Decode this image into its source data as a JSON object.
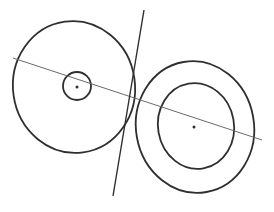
{
  "diagram": {
    "width": 274,
    "height": 212,
    "background": "#ffffff",
    "stroke_color": "#2f2f2f",
    "thin_stroke_color": "#6a6a6a",
    "shapes": {
      "left_outer_ellipse": {
        "cx": 74,
        "cy": 87,
        "rx": 61,
        "ry": 66,
        "rotate": -8,
        "stroke_width": 1.8
      },
      "left_inner_circle": {
        "cx": 77,
        "cy": 86,
        "rx": 14,
        "ry": 14,
        "rotate": 0,
        "stroke_width": 1.8
      },
      "right_outer_ellipse": {
        "cx": 195,
        "cy": 127,
        "rx": 59,
        "ry": 66,
        "rotate": -10,
        "stroke_width": 1.8
      },
      "right_inner_ellipse": {
        "cx": 196,
        "cy": 126,
        "rx": 38,
        "ry": 43,
        "rotate": -10,
        "stroke_width": 1.8
      },
      "left_center_dot": {
        "cx": 77,
        "cy": 87,
        "r": 1.5
      },
      "right_center_dot": {
        "cx": 194,
        "cy": 127,
        "r": 1.5
      },
      "center_line": {
        "x1": 13,
        "y1": 58,
        "x2": 262,
        "y2": 140,
        "stroke_width": 1
      },
      "tangent_line": {
        "x1": 144,
        "y1": 10,
        "x2": 113,
        "y2": 196,
        "stroke_width": 1.4
      }
    }
  }
}
